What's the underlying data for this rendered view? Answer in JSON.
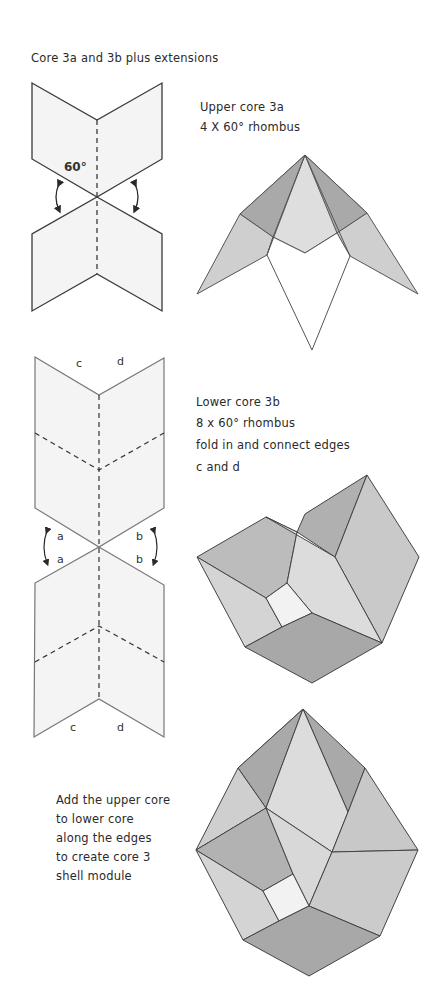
{
  "title": "Core 3a and 3b plus extensions",
  "upper_core": {
    "heading": "Upper core 3a",
    "subheading": "4 X 60° rhombus",
    "angle_label": "60°"
  },
  "lower_core": {
    "heading": "Lower core 3b",
    "line2": "8 x 60° rhombus",
    "line3": "fold in and connect edges",
    "line4": "c and d",
    "edge_labels": {
      "c": "c",
      "d": "d",
      "a": "a",
      "b": "b"
    }
  },
  "assembly": {
    "lines": [
      "Add the upper core",
      "to lower core",
      "along the edges",
      "to create core 3",
      "shell module"
    ]
  },
  "colors": {
    "paper": "#f4f4f4",
    "stroke": "#3a3a3a",
    "dark_face": "#a9a9a9",
    "mid_face": "#c6c6c6",
    "light_face": "#dedede",
    "lightest_face": "#f0f0f0"
  }
}
